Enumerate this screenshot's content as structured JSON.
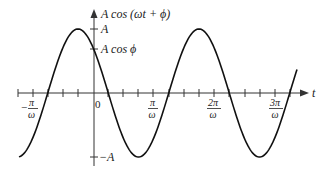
{
  "diagram": {
    "type": "cosine-wave-plot",
    "y_axis_label": "A cos (ωt + ϕ)",
    "x_axis_label": "t",
    "y_tick_labels": {
      "top": "A",
      "intercept": "A cos ϕ",
      "bottom": "−A"
    },
    "x_tick_labels": [
      {
        "id": "neg_pi",
        "sign": "−",
        "numerator": "π",
        "denominator": "ω"
      },
      {
        "id": "zero",
        "text": "0"
      },
      {
        "id": "pi",
        "numerator": "π",
        "denominator": "ω"
      },
      {
        "id": "two_pi",
        "numerator": "2π",
        "denominator": "ω"
      },
      {
        "id": "three_pi",
        "numerator": "3π",
        "denominator": "ω"
      }
    ],
    "curve": {
      "function": "A cos(ωt + ϕ)",
      "phase": "π/4",
      "stroke_color": "#111111"
    },
    "colors": {
      "axis": "#333333",
      "curve": "#111111",
      "text": "#222222"
    }
  }
}
